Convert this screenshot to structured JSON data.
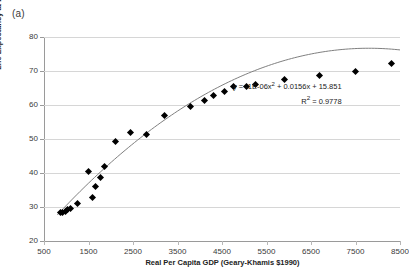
{
  "figure": {
    "panel_label": "(a)"
  },
  "chart_data": {
    "type": "scatter",
    "title": "",
    "xlabel": "Real Per Capita GDP (Geary-Khamis $1990)",
    "ylabel": "Life Expectancy at Birth (LEB)",
    "xlim": [
      500,
      8500
    ],
    "ylim": [
      20,
      80
    ],
    "xticks": [
      500,
      1500,
      2500,
      3500,
      4500,
      5500,
      6500,
      7500,
      8500
    ],
    "xtick_labels": [
      "500",
      "1500",
      "2500",
      "3500",
      "4500",
      "5500",
      "6500",
      "7500",
      "8500"
    ],
    "yticks": [
      20,
      30,
      40,
      50,
      60,
      70,
      80
    ],
    "ytick_labels": [
      "20",
      "30",
      "40",
      "50",
      "60",
      "70",
      "80"
    ],
    "grid": "horizontal",
    "legend": "none",
    "marker": "diamond",
    "marker_color": "#000000",
    "trendline_color": "#808080",
    "x": [
      870,
      905,
      975,
      1030,
      1100,
      1250,
      1500,
      1600,
      1660,
      1760,
      1850,
      2100,
      2450,
      2800,
      3200,
      3800,
      4100,
      4320,
      4560,
      4760,
      5060,
      5260,
      5900,
      6700,
      7500,
      8300
    ],
    "y": [
      28.3,
      28.4,
      28.6,
      29.2,
      29.7,
      30.9,
      40.3,
      32.7,
      35.9,
      38.7,
      41.8,
      49.3,
      52.0,
      51.2,
      57.0,
      59.5,
      61.3,
      62.9,
      64.1,
      65.3,
      65.3,
      66.1,
      67.5,
      68.7,
      69.8,
      72.1
    ],
    "trendline": {
      "type": "polynomial",
      "degree": 2,
      "coefficients": [
        -1e-06,
        0.0156,
        15.851
      ],
      "equation": "y = -1E-06x² + 0.0156x + 15.851",
      "r_squared_label": "R² = 0.9778",
      "r_squared": 0.9778
    },
    "annotation": {
      "equation_prefix": "y = -1E-06x",
      "equation_exponent": "2",
      "equation_suffix": " + 0.0156x + 15.851",
      "r2_prefix": "R",
      "r2_exponent": "2",
      "r2_suffix": " = 0.9778"
    }
  }
}
